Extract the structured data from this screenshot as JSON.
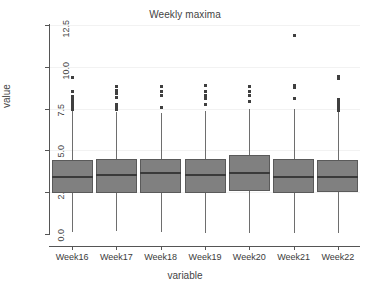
{
  "chart_data": {
    "type": "box",
    "title": "Weekly maxima",
    "xlabel": "variable",
    "ylabel": "value",
    "grid": true,
    "legend": "none",
    "ylim": [
      0.0,
      12.5
    ],
    "yticks": [
      0.0,
      2.5,
      5.0,
      7.5,
      10.0,
      12.5
    ],
    "ytick_labels": [
      "0.0",
      "2.5",
      "5.0",
      "7.5",
      "10.0",
      "12.5"
    ],
    "categories": [
      "Week16",
      "Week17",
      "Week18",
      "Week19",
      "Week20",
      "Week21",
      "Week22"
    ],
    "boxes": [
      {
        "category": "Week16",
        "whisker_low": 0.1,
        "q1": 2.46,
        "median": 3.4,
        "q3": 4.4,
        "whisker_high": 7.35,
        "outliers": [
          7.45,
          7.55,
          7.65,
          7.75,
          7.9,
          8.05,
          8.2,
          8.55,
          9.35
        ]
      },
      {
        "category": "Week17",
        "whisker_low": 0.15,
        "q1": 2.48,
        "median": 3.55,
        "q3": 4.48,
        "whisker_high": 7.3,
        "outliers": [
          7.45,
          7.6,
          7.75,
          8.15,
          8.4,
          8.6,
          8.85
        ]
      },
      {
        "category": "Week18",
        "whisker_low": 0.12,
        "q1": 2.47,
        "median": 3.62,
        "q3": 4.48,
        "whisker_high": 7.25,
        "outliers": [
          7.55,
          8.3,
          8.5,
          8.8
        ]
      },
      {
        "category": "Week19",
        "whisker_low": 0.08,
        "q1": 2.46,
        "median": 3.55,
        "q3": 4.48,
        "whisker_high": 7.35,
        "outliers": [
          7.75,
          8.1,
          8.3,
          8.55,
          8.9
        ]
      },
      {
        "category": "Week20",
        "whisker_low": 0.08,
        "q1": 2.55,
        "median": 3.65,
        "q3": 4.7,
        "whisker_high": 7.45,
        "outliers": [
          7.95,
          8.3,
          8.5,
          8.85
        ]
      },
      {
        "category": "Week21",
        "whisker_low": 0.08,
        "q1": 2.45,
        "median": 3.4,
        "q3": 4.48,
        "whisker_high": 7.5,
        "outliers": [
          8.1,
          8.75,
          8.9,
          11.9
        ]
      },
      {
        "category": "Week22",
        "whisker_low": 0.08,
        "q1": 2.5,
        "median": 3.42,
        "q3": 4.4,
        "whisker_high": 7.3,
        "outliers": [
          7.4,
          7.55,
          7.65,
          7.8,
          7.95,
          8.05,
          9.3,
          9.4
        ]
      }
    ],
    "colors": {
      "box_fill": "#808080",
      "box_border": "#5a5a5a",
      "median": "#3a3a3a",
      "whisker": "#6e6e6e",
      "outlier": "#3f3f3f",
      "axis": "#555555",
      "grid": "#f2f2f2",
      "text": "#3b3b3b",
      "background": "#ffffff"
    }
  }
}
